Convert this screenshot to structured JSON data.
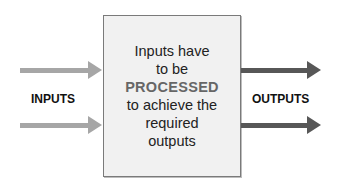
{
  "diagram": {
    "left_label": "INPUTS",
    "right_label": "OUTPUTS",
    "process_box": {
      "lines": [
        "Inputs have",
        "to be",
        "PROCESSED",
        "to achieve the",
        "required",
        "outputs"
      ],
      "emphasized_line_index": 2
    },
    "arrows": {
      "inputs": [
        {
          "direction": "right",
          "color": "#a6a6a6"
        },
        {
          "direction": "right",
          "color": "#a6a6a6"
        }
      ],
      "outputs": [
        {
          "direction": "right",
          "color": "#575757"
        },
        {
          "direction": "right",
          "color": "#575757"
        }
      ]
    },
    "colors": {
      "box_fill": "#f1f1f1",
      "box_border": "#7a7a7a",
      "input_arrow": "#a6a6a6",
      "output_arrow": "#575757",
      "emphasis_text": "#666666"
    }
  }
}
